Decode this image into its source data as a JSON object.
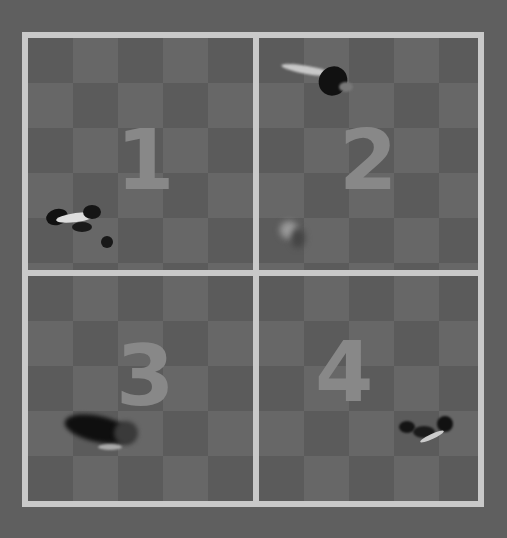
{
  "arena": {
    "layout": "2x2 grid",
    "border_color": "#c9c9c9",
    "background_color": "#5f5f5f",
    "quadrants": [
      {
        "label": "1",
        "animal_position": "bottom-left"
      },
      {
        "label": "2",
        "animal_position": "top-center"
      },
      {
        "label": "3",
        "animal_position": "bottom-left"
      },
      {
        "label": "4",
        "animal_position": "bottom-right"
      }
    ]
  }
}
